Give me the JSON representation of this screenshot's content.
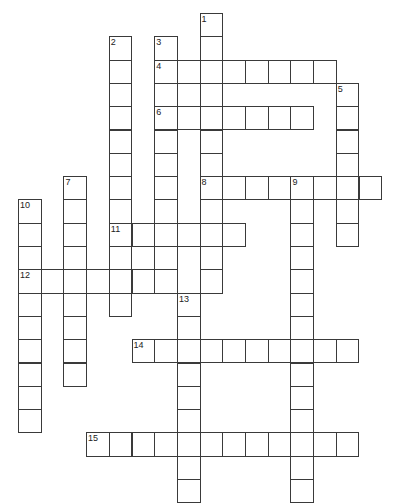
{
  "puzzle": {
    "grid": {
      "origin_x": 18,
      "origin_y": 13,
      "cell_width": 22.7,
      "cell_height": 23.3,
      "line_color": "#3a3a3a",
      "background": "#ffffff"
    },
    "words": [
      {
        "number": "1",
        "direction": "down",
        "row": 0,
        "col": 8,
        "length": 12
      },
      {
        "number": "2",
        "direction": "down",
        "row": 1,
        "col": 4,
        "length": 12
      },
      {
        "number": "3",
        "direction": "down",
        "row": 1,
        "col": 6,
        "length": 11
      },
      {
        "number": "4",
        "direction": "across",
        "row": 2,
        "col": 6,
        "length": 8
      },
      {
        "number": "5",
        "direction": "down",
        "row": 3,
        "col": 14,
        "length": 7
      },
      {
        "number": "6",
        "direction": "across",
        "row": 4,
        "col": 6,
        "length": 7
      },
      {
        "number": "7",
        "direction": "down",
        "row": 7,
        "col": 2,
        "length": 9
      },
      {
        "number": "8",
        "direction": "across",
        "row": 7,
        "col": 8,
        "length": 8
      },
      {
        "number": "9",
        "direction": "down",
        "row": 7,
        "col": 12,
        "length": 14
      },
      {
        "number": "10",
        "direction": "down",
        "row": 8,
        "col": 0,
        "length": 10
      },
      {
        "number": "11",
        "direction": "across",
        "row": 9,
        "col": 4,
        "length": 6
      },
      {
        "number": "12",
        "direction": "across",
        "row": 11,
        "col": 0,
        "length": 7
      },
      {
        "number": "13",
        "direction": "down",
        "row": 12,
        "col": 7,
        "length": 9
      },
      {
        "number": "14",
        "direction": "across",
        "row": 14,
        "col": 5,
        "length": 10
      },
      {
        "number": "15",
        "direction": "across",
        "row": 18,
        "col": 3,
        "length": 12
      }
    ]
  }
}
